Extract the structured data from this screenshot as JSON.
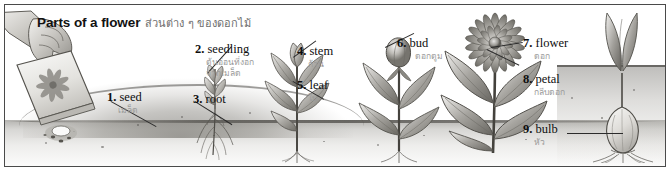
{
  "figure": {
    "title_en": "Parts of a flower",
    "title_th": "ส่วนต่าง ๆ ของดอกไม้",
    "border_color": "#4a4a4a",
    "background": "#ffffff",
    "ink_color": "#0e0e0e",
    "thai_color": "#9a9a9a",
    "width": 670,
    "height": 171
  },
  "labels": [
    {
      "num": "1.",
      "en": "seed",
      "th": "เมล็ด"
    },
    {
      "num": "2.",
      "en": "seedling",
      "th": "ต้นอ่อนที่งอก",
      "th2": "จากเมล็ด"
    },
    {
      "num": "3.",
      "en": "root",
      "th": ""
    },
    {
      "num": "4.",
      "en": "stem",
      "th": "ก้าน"
    },
    {
      "num": "5.",
      "en": "leaf",
      "th": "ใบ"
    },
    {
      "num": "6.",
      "en": "bud",
      "th": "ดอกตูม"
    },
    {
      "num": "7.",
      "en": "flower",
      "th": "ดอก"
    },
    {
      "num": "8.",
      "en": "petal",
      "th": "กลีบดอก"
    },
    {
      "num": "9.",
      "en": "bulb",
      "th": "หัว"
    }
  ],
  "scene": {
    "items": [
      {
        "name": "hand-with-seed-packet"
      },
      {
        "name": "seed-on-ground"
      },
      {
        "name": "seedling-with-roots"
      },
      {
        "name": "young-plant-stem-leaf"
      },
      {
        "name": "plant-with-bud"
      },
      {
        "name": "flowering-plant"
      },
      {
        "name": "bulb-cross-section"
      }
    ]
  }
}
